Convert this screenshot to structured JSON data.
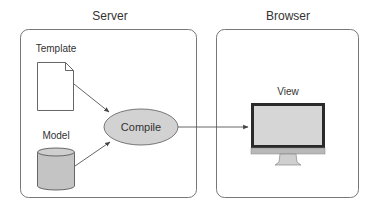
{
  "diagram": {
    "groups": [
      {
        "id": "server",
        "title": "Server"
      },
      {
        "id": "browser",
        "title": "Browser"
      }
    ],
    "nodes": {
      "template": {
        "label": "Template",
        "shape": "document-icon"
      },
      "model": {
        "label": "Model",
        "shape": "database-cylinder-icon"
      },
      "compile": {
        "label": "Compile",
        "shape": "ellipse"
      },
      "view": {
        "label": "View",
        "shape": "monitor-icon"
      }
    },
    "edges": [
      {
        "from": "Template",
        "to": "Compile"
      },
      {
        "from": "Model",
        "to": "Compile"
      },
      {
        "from": "Compile",
        "to": "View"
      }
    ],
    "colors": {
      "stroke": "#555555",
      "fill_gray": "#c8c8c8",
      "monitor_bezel": "#222222",
      "screen": "#d4d4d4"
    }
  }
}
